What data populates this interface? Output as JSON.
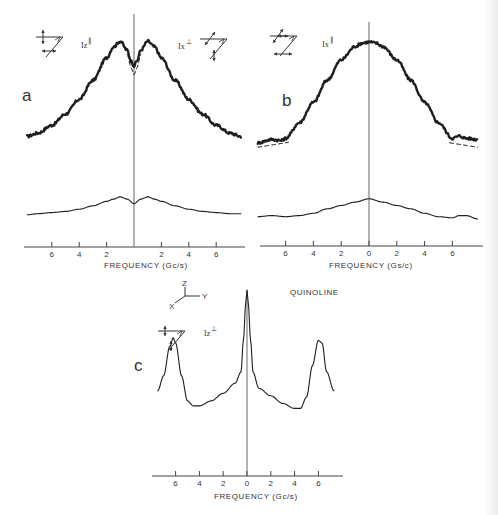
{
  "figure": {
    "compound": "QUINOLINE",
    "coordinate_axes": {
      "x": "X",
      "y": "Y",
      "z": "Z"
    }
  },
  "panels": [
    {
      "id": "a",
      "letter": "a",
      "xlabel": "FREQUENCY (Gc/s)",
      "tick_labels": [
        "6",
        "4",
        "2",
        "2",
        "4",
        "6"
      ],
      "polarizations": [
        {
          "label": "Iz",
          "sup": "∥",
          "icon": "polarization-geometry-icon"
        },
        {
          "label": "Ix",
          "sup": "⊥",
          "icon": "polarization-geometry-icon"
        }
      ]
    },
    {
      "id": "b",
      "letter": "b",
      "xlabel": "FREQUENCY (Gs/c)",
      "tick_labels": [
        "6",
        "4",
        "2",
        "0",
        "2",
        "4",
        "6"
      ],
      "polarizations": [
        {
          "label": "Ix",
          "sup": "∥",
          "icon": "polarization-geometry-icon"
        }
      ]
    },
    {
      "id": "c",
      "letter": "c",
      "xlabel": "FREQUENCY (Gc/s)",
      "tick_labels": [
        "6",
        "4",
        "2",
        "0",
        "2",
        "4",
        "6"
      ],
      "polarizations": [
        {
          "label": "Iz",
          "sup": "⊥",
          "icon": "polarization-geometry-icon"
        }
      ]
    }
  ],
  "chart_data": [
    {
      "type": "line",
      "panel": "a",
      "title": "",
      "xlabel": "FREQUENCY (Gc/s)",
      "ylabel": "",
      "xlim": [
        -8,
        8
      ],
      "x_ticks": [
        -6,
        -4,
        -2,
        2,
        4,
        6
      ],
      "tick_labels": [
        "6",
        "4",
        "2",
        "2",
        "4",
        "6"
      ],
      "grid": false,
      "legend": [
        "Iz∥",
        "Ix⊥"
      ],
      "series": [
        {
          "name": "Iz∥ / Ix⊥ spectrum (upper, heavy, noisy)",
          "x": [
            -7.8,
            -7,
            -6,
            -5,
            -4,
            -3,
            -2,
            -1.5,
            -1,
            -0.5,
            -0.2,
            0,
            0.2,
            0.5,
            1,
            1.5,
            2,
            3,
            4,
            5,
            6,
            7,
            7.8
          ],
          "values": [
            0.05,
            0.08,
            0.15,
            0.25,
            0.38,
            0.55,
            0.75,
            0.85,
            0.9,
            0.82,
            0.72,
            0.68,
            0.72,
            0.82,
            0.9,
            0.85,
            0.75,
            0.55,
            0.38,
            0.25,
            0.15,
            0.08,
            0.05
          ]
        },
        {
          "name": "dashed fit near origin",
          "x": [
            -0.5,
            -0.2,
            0,
            0.2,
            0.5
          ],
          "values": [
            0.78,
            0.66,
            0.6,
            0.66,
            0.78
          ]
        },
        {
          "name": "lower trace (thin)",
          "x": [
            -7.8,
            -7,
            -6,
            -5,
            -4,
            -3,
            -2,
            -1.5,
            -1,
            -0.5,
            0,
            0.5,
            1,
            1.5,
            2,
            3,
            4,
            5,
            6,
            7,
            7.8
          ],
          "values": [
            -0.65,
            -0.64,
            -0.63,
            -0.62,
            -0.6,
            -0.57,
            -0.53,
            -0.51,
            -0.49,
            -0.51,
            -0.55,
            -0.51,
            -0.49,
            -0.51,
            -0.53,
            -0.57,
            -0.6,
            -0.62,
            -0.63,
            -0.64,
            -0.64
          ]
        }
      ]
    },
    {
      "type": "line",
      "panel": "b",
      "title": "",
      "xlabel": "FREQUENCY (Gs/c)",
      "ylabel": "",
      "xlim": [
        -8,
        8
      ],
      "x_ticks": [
        -6,
        -4,
        -2,
        0,
        2,
        4,
        6
      ],
      "tick_labels": [
        "6",
        "4",
        "2",
        "0",
        "2",
        "4",
        "6"
      ],
      "grid": false,
      "legend": [
        "Ix∥"
      ],
      "series": [
        {
          "name": "Ix∥ spectrum (upper, heavy, noisy)",
          "x": [
            -8,
            -7,
            -6.3,
            -6,
            -5,
            -4,
            -3,
            -2,
            -1,
            -0.5,
            0,
            0.5,
            1,
            2,
            3,
            4,
            5,
            6,
            6.5,
            7,
            7.8
          ],
          "values": [
            0.02,
            0.05,
            0.04,
            0.06,
            0.2,
            0.38,
            0.58,
            0.76,
            0.88,
            0.91,
            0.92,
            0.91,
            0.88,
            0.76,
            0.58,
            0.38,
            0.2,
            0.06,
            0.08,
            0.06,
            0.05
          ]
        },
        {
          "name": "dashed theoretical fit (wings)",
          "x": [
            -8,
            -7,
            -6,
            6,
            7,
            7.8
          ],
          "values": [
            -0.02,
            -0.01,
            0.02,
            0.02,
            -0.01,
            -0.02
          ]
        },
        {
          "name": "lower trace (thin)",
          "x": [
            -8,
            -7,
            -6,
            -5,
            -4,
            -3,
            -2,
            -1,
            0,
            1,
            2,
            3,
            4,
            5,
            6,
            6.5,
            7,
            7.8
          ],
          "values": [
            -0.64,
            -0.63,
            -0.64,
            -0.63,
            -0.61,
            -0.57,
            -0.54,
            -0.51,
            -0.48,
            -0.51,
            -0.54,
            -0.57,
            -0.61,
            -0.64,
            -0.65,
            -0.63,
            -0.63,
            -0.66
          ]
        }
      ]
    },
    {
      "type": "line",
      "panel": "c",
      "title": "",
      "xlabel": "FREQUENCY (Gc/s)",
      "ylabel": "",
      "xlim": [
        -8,
        8
      ],
      "x_ticks": [
        -6,
        -4,
        -2,
        0,
        2,
        4,
        6
      ],
      "tick_labels": [
        "6",
        "4",
        "2",
        "0",
        "2",
        "4",
        "6"
      ],
      "grid": false,
      "legend": [
        "Iz⊥"
      ],
      "series": [
        {
          "name": "Iz⊥ spectrum",
          "x": [
            -7.5,
            -7,
            -6.5,
            -6.2,
            -6,
            -5.5,
            -5,
            -4.5,
            -4,
            -3,
            -2,
            -1,
            -0.5,
            -0.3,
            -0.1,
            0,
            0.1,
            0.3,
            0.5,
            1,
            2,
            3,
            4,
            4.5,
            5,
            5.5,
            6,
            6.3,
            6.7,
            7.3
          ],
          "values": [
            0.2,
            0.32,
            0.55,
            0.62,
            0.58,
            0.32,
            0.12,
            0.08,
            0.08,
            0.12,
            0.18,
            0.26,
            0.35,
            0.6,
            0.9,
            1.0,
            0.9,
            0.6,
            0.35,
            0.22,
            0.16,
            0.1,
            0.06,
            0.06,
            0.15,
            0.4,
            0.6,
            0.58,
            0.35,
            0.2
          ]
        }
      ]
    }
  ]
}
